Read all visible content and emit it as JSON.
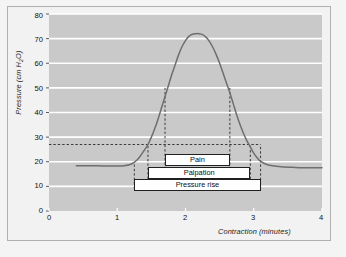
{
  "chart_data": {
    "type": "line",
    "title": "",
    "subtitle": "",
    "xlabel": "Contraction (minutes)",
    "ylabel": "Pressure (cm H2O)",
    "ylabel_display": "Pressure (cm H₂O)",
    "xlim": [
      0,
      4
    ],
    "ylim": [
      0,
      80
    ],
    "xticks": [
      "0",
      "1",
      "2",
      "3",
      "4"
    ],
    "xtick_values": [
      0,
      1,
      2,
      3,
      4
    ],
    "yticks": [
      "0",
      "10",
      "20",
      "30",
      "40",
      "50",
      "60",
      "70",
      "80"
    ],
    "ytick_values": [
      0,
      10,
      20,
      30,
      40,
      50,
      60,
      70,
      80
    ],
    "grid": "horizontal-white-gridlines",
    "legend": "none",
    "plot_background": "#c9c9c9",
    "gridline_color": "#ffffff",
    "curve_color": "#6e6e6e",
    "baseline_pressure": 18,
    "peak_pressure": 72,
    "peak_time": 2.2,
    "series": [
      {
        "name": "Intrauterine pressure",
        "x": [
          0.4,
          0.6,
          0.8,
          1.0,
          1.1,
          1.2,
          1.25,
          1.3,
          1.35,
          1.4,
          1.45,
          1.5,
          1.55,
          1.6,
          1.65,
          1.7,
          1.75,
          1.8,
          1.85,
          1.9,
          1.95,
          2.0,
          2.05,
          2.1,
          2.15,
          2.2,
          2.25,
          2.3,
          2.35,
          2.4,
          2.45,
          2.5,
          2.55,
          2.6,
          2.65,
          2.7,
          2.75,
          2.8,
          2.85,
          2.9,
          2.95,
          3.0,
          3.05,
          3.1,
          3.2,
          3.4,
          3.6,
          3.8,
          4.0
        ],
        "y": [
          18.4,
          18.4,
          18.3,
          18.3,
          18.4,
          19.0,
          19.8,
          21.0,
          22.8,
          24.8,
          27.0,
          30.0,
          33.5,
          37.5,
          42.0,
          46.5,
          51.0,
          55.5,
          59.5,
          63.5,
          66.8,
          69.2,
          70.9,
          71.8,
          72.0,
          72.0,
          71.6,
          70.6,
          68.9,
          66.5,
          63.5,
          60.0,
          56.0,
          52.0,
          48.0,
          43.5,
          39.0,
          35.0,
          31.5,
          28.5,
          26.0,
          23.5,
          21.6,
          20.2,
          18.8,
          18.0,
          17.7,
          17.6,
          17.6
        ]
      }
    ],
    "reference_lines": [
      {
        "name": "pain-threshold-horizontal",
        "orientation": "horizontal",
        "value": 27,
        "style": "dashed",
        "x_from": 0,
        "x_to": 3.1
      },
      {
        "name": "pressure-rise-onset",
        "orientation": "vertical",
        "value": 1.25,
        "style": "dashed",
        "y_from": 9,
        "y_to": 20
      },
      {
        "name": "palpation-onset",
        "orientation": "vertical",
        "value": 1.45,
        "style": "dashed",
        "y_from": 13,
        "y_to": 27
      },
      {
        "name": "pain-onset",
        "orientation": "vertical",
        "value": 1.7,
        "style": "dashed",
        "y_from": 17,
        "y_to": 50
      },
      {
        "name": "pain-end",
        "orientation": "vertical",
        "value": 2.65,
        "style": "dashed",
        "y_from": 17,
        "y_to": 50
      },
      {
        "name": "palpation-end",
        "orientation": "vertical",
        "value": 2.95,
        "style": "dashed",
        "y_from": 13,
        "y_to": 27
      },
      {
        "name": "pressure-rise-end",
        "orientation": "vertical",
        "value": 3.1,
        "style": "dashed",
        "y_from": 9,
        "y_to": 27
      }
    ],
    "annotations": [
      {
        "name": "pain",
        "label": "Pain",
        "x_from": 1.7,
        "x_to": 2.65,
        "y_center": 20.6
      },
      {
        "name": "palpation",
        "label": "Palpation",
        "x_from": 1.45,
        "x_to": 2.95,
        "y_center": 15.6
      },
      {
        "name": "pressure_rise",
        "label": "Pressure rise",
        "x_from": 1.25,
        "x_to": 3.1,
        "y_center": 10.6
      }
    ]
  },
  "axes": {
    "y_title_prefix": "Pressure (cm H",
    "y_title_sub": "2",
    "y_title_suffix": "O)",
    "x_title": "Contraction (minutes)"
  },
  "ytick_labels": {
    "t0": "0",
    "t10": "10",
    "t20": "20",
    "t30": "30",
    "t40": "40",
    "t50": "50",
    "t60": "60",
    "t70": "70",
    "t80": "80"
  },
  "xtick_labels": {
    "t0": "0",
    "t1": "1",
    "t2": "2",
    "t3": "3",
    "t4": "4"
  },
  "boxes": {
    "pain": "Pain",
    "palpation": "Palpation",
    "pressure_rise": "Pressure rise"
  }
}
